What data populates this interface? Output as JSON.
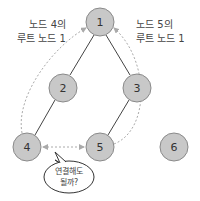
{
  "colors": {
    "node_fill": "#c8c8c8",
    "node_stroke": "#8a8a8a",
    "edge": "#444444",
    "dashed_arrow": "#aaaaaa",
    "text": "#333333"
  },
  "nodes": [
    {
      "id": "1",
      "label": "1",
      "x": 100,
      "y": 22
    },
    {
      "id": "2",
      "label": "2",
      "x": 63,
      "y": 88
    },
    {
      "id": "3",
      "label": "3",
      "x": 137,
      "y": 88
    },
    {
      "id": "4",
      "label": "4",
      "x": 27,
      "y": 147
    },
    {
      "id": "5",
      "label": "5",
      "x": 100,
      "y": 147
    },
    {
      "id": "6",
      "label": "6",
      "x": 174,
      "y": 147
    }
  ],
  "edges": [
    {
      "from": "1",
      "to": "2"
    },
    {
      "from": "1",
      "to": "3"
    },
    {
      "from": "2",
      "to": "4"
    },
    {
      "from": "3",
      "to": "5"
    }
  ],
  "annotations": {
    "left_line1": "노드 4의",
    "left_line2": "루트 노드 1",
    "right_line1": "노드 5의",
    "right_line2": "루트 노드 1"
  },
  "bubble": {
    "line1": "연결해도",
    "line2": "될까?"
  }
}
